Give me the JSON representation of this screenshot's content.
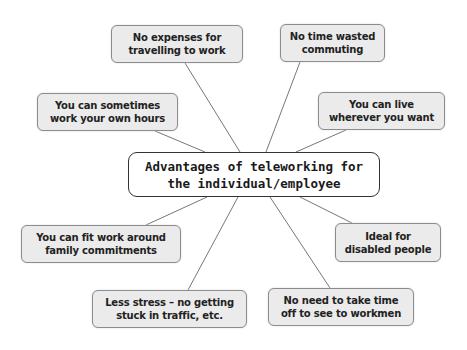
{
  "diagram": {
    "type": "mind-map",
    "center": {
      "label": "Advantages of teleworking for\nthe individual/employee"
    },
    "nodes": [
      {
        "id": "expenses",
        "label": "No expenses for\ntravelling to work"
      },
      {
        "id": "commuting",
        "label": "No time wasted\ncommuting"
      },
      {
        "id": "own-hours",
        "label": "You can sometimes\nwork your own hours"
      },
      {
        "id": "live-anywhere",
        "label": "You can live\nwherever you want"
      },
      {
        "id": "family",
        "label": "You can fit work around\nfamily commitments"
      },
      {
        "id": "disabled",
        "label": "Ideal for\ndisabled people"
      },
      {
        "id": "stress",
        "label": "Less stress – no getting\nstuck in traffic, etc."
      },
      {
        "id": "workmen",
        "label": "No need to take time\noff to see to workmen"
      }
    ],
    "colors": {
      "node_fill": "#ebebeb",
      "node_border": "#8c8c8c",
      "center_fill": "#ffffff",
      "center_border": "#333333",
      "connector": "#777777"
    }
  }
}
